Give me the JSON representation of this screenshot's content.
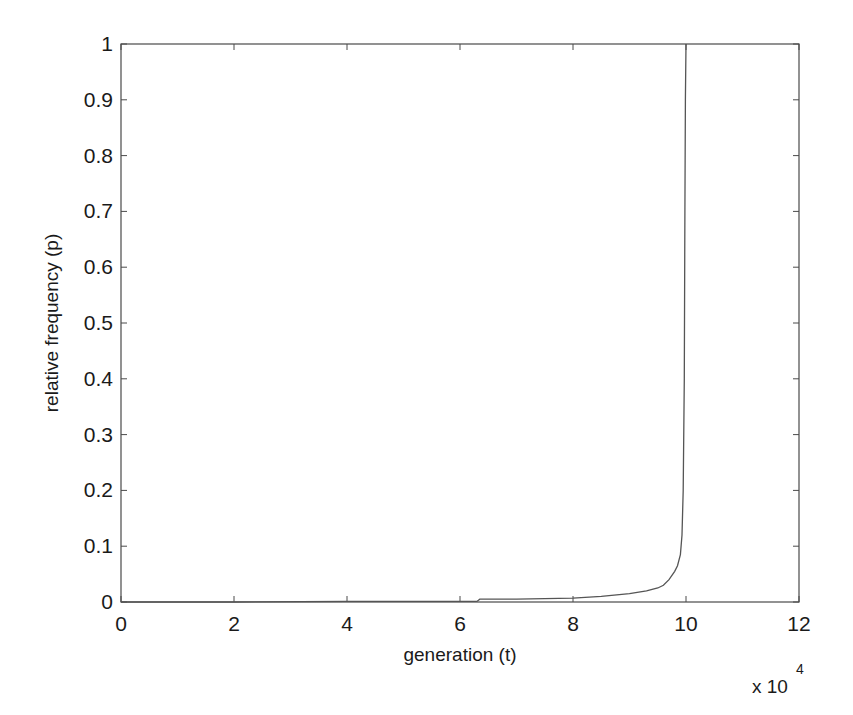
{
  "chart_data": {
    "type": "line",
    "title": "",
    "xlabel": "generation (t)",
    "ylabel": "relative frequency (p)",
    "x_multiplier": "x 10",
    "x_multiplier_exponent": "4",
    "xlim": [
      0,
      12
    ],
    "ylim": [
      0,
      1
    ],
    "xticks": [
      0,
      2,
      4,
      6,
      8,
      10,
      12
    ],
    "xtick_labels": [
      "0",
      "2",
      "4",
      "6",
      "8",
      "10",
      "12"
    ],
    "yticks": [
      0,
      0.1,
      0.2,
      0.3,
      0.4,
      0.5,
      0.6,
      0.7,
      0.8,
      0.9,
      1
    ],
    "ytick_labels": [
      "0",
      "0.1",
      "0.2",
      "0.3",
      "0.4",
      "0.5",
      "0.6",
      "0.7",
      "0.8",
      "0.9",
      "1"
    ],
    "grid": false,
    "legend": null,
    "series": [
      {
        "name": "p",
        "color": "#555555",
        "x": [
          0,
          2,
          4,
          6,
          6.3,
          6.35,
          7,
          8,
          8.5,
          9.0,
          9.3,
          9.5,
          9.6,
          9.7,
          9.8,
          9.85,
          9.9,
          9.93,
          9.95,
          9.97,
          9.98,
          9.99,
          10.0
        ],
        "y": [
          0.0,
          0.0,
          0.001,
          0.001,
          0.001,
          0.005,
          0.005,
          0.007,
          0.01,
          0.015,
          0.02,
          0.025,
          0.03,
          0.04,
          0.055,
          0.065,
          0.085,
          0.12,
          0.2,
          0.4,
          0.7,
          0.9,
          1.0
        ]
      }
    ]
  }
}
